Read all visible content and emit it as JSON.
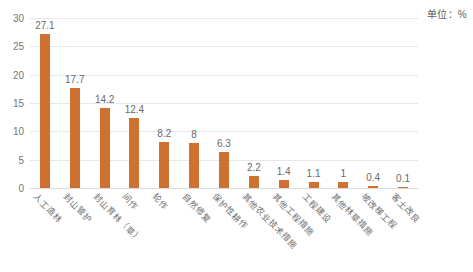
{
  "caption": {
    "unit": "单位：%"
  },
  "chart_data": {
    "type": "bar",
    "title": "",
    "subtitle": "",
    "xlabel": "",
    "ylabel": "",
    "unit_note": "单位：%",
    "grid": true,
    "legend": "none",
    "ylim": [
      0,
      30
    ],
    "yticks": [
      0,
      5,
      10,
      15,
      20,
      25,
      30
    ],
    "ytick_labels": [
      "0",
      "5",
      "10",
      "15",
      "20",
      "25",
      "30"
    ],
    "bar_color": "#cf7231",
    "grid_color": "#e8e8e8",
    "categories": [
      "人工造林",
      "封山管护",
      "封山育林（草）",
      "间作",
      "轮作",
      "自然修复",
      "保护性耕作",
      "其他农业技术措施",
      "其他工程措施",
      "工程建设",
      "其他林草措施",
      "坡改梯工程",
      "客土改良"
    ],
    "values": [
      27.1,
      17.7,
      14.2,
      12.4,
      8.2,
      8,
      6.3,
      2.2,
      1.4,
      1.1,
      1,
      0.4,
      0.1
    ],
    "value_labels": [
      "27.1",
      "17.7",
      "14.2",
      "12.4",
      "8.2",
      "8",
      "6.3",
      "2.2",
      "1.4",
      "1.1",
      "1",
      "0.4",
      "0.1"
    ]
  }
}
